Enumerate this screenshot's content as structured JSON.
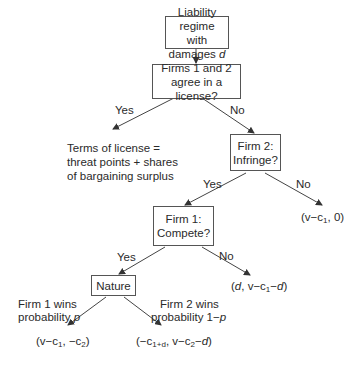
{
  "diagram": {
    "type": "game-tree",
    "nodes": {
      "root": {
        "line1": "Liability regime",
        "line2_prefix": "with damages ",
        "line2_var": "d"
      },
      "license": {
        "line1": "Firms 1 and 2",
        "line2": "agree in a license?"
      },
      "infringe": {
        "line1": "Firm 2:",
        "line2": "Infringe?"
      },
      "compete": {
        "line1": "Firm 1:",
        "line2": "Compete?"
      },
      "nature": {
        "label": "Nature"
      }
    },
    "edge_labels": {
      "license_yes": "Yes",
      "license_no": "No",
      "infringe_yes": "Yes",
      "infringe_no": "No",
      "compete_yes": "Yes",
      "compete_no": "No",
      "nature_left_line1": "Firm 1 wins",
      "nature_left_line2_prefix": "probability ",
      "nature_left_line2_var": "p",
      "nature_right_line1": "Firm 2 wins",
      "nature_right_line2_prefix": "probability 1−",
      "nature_right_line2_var": "p"
    },
    "outcomes": {
      "license_terms": {
        "line1": "Terms of license =",
        "line2": "threat points + shares",
        "line3": "of bargaining surplus"
      },
      "no_infringe": {
        "text": "(v−c",
        "sub1": "1",
        "tail": ", 0)"
      },
      "no_compete": {
        "open": "(",
        "var_d": "d",
        "mid": ", v−c",
        "sub1": "1",
        "tail": "−",
        "var_d2": "d",
        "close": ")"
      },
      "firm1_wins": {
        "p1": "(v−c",
        "sub1": "1",
        "p2": ", −c",
        "sub2": "2",
        "p3": ")"
      },
      "firm2_wins": {
        "p1": "(−c",
        "sub1": "1+d",
        "p2": ", v−c",
        "sub2": "2",
        "p3": "−",
        "var_d": "d",
        "p4": ")"
      }
    }
  }
}
